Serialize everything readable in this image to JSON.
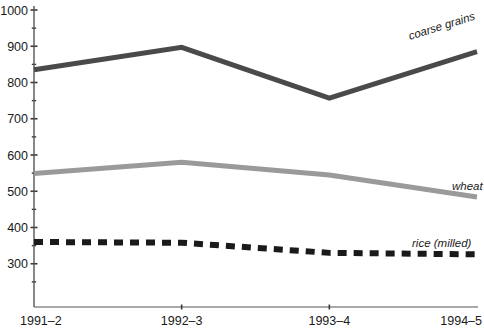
{
  "chart_data": {
    "type": "line",
    "title": "",
    "xlabel": "",
    "ylabel": "",
    "categories": [
      "1991–2",
      "1992–3",
      "1993–4",
      "1994–5"
    ],
    "ylim": [
      250,
      1000
    ],
    "ytick_labels": [
      "1000",
      "900",
      "800",
      "700",
      "600",
      "500",
      "400",
      "300"
    ],
    "ytick_values": [
      1000,
      900,
      800,
      700,
      600,
      500,
      400,
      300
    ],
    "minor_tick_step": 50,
    "grid": false,
    "legend": "inline-end-of-line",
    "series": [
      {
        "name": "coarse grains",
        "label": "coarse grains",
        "color": "#4a4a4a",
        "style": "solid",
        "width": 5,
        "values": [
          835,
          897,
          757,
          885
        ]
      },
      {
        "name": "wheat",
        "label": "wheat",
        "color": "#9a9a9a",
        "style": "solid",
        "width": 5,
        "values": [
          549,
          580,
          545,
          484
        ]
      },
      {
        "name": "rice (milled)",
        "label": "rice (milled)",
        "color": "#1a1a1a",
        "style": "dashed",
        "width": 6,
        "values": [
          360,
          358,
          330,
          326
        ]
      }
    ]
  },
  "axes": {
    "y_axis_name": "y-axis",
    "x_axis_name": "x-axis"
  }
}
